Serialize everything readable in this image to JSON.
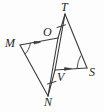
{
  "figure": {
    "kind": "geometry-diagram",
    "stroke_color": "#3c3c3c",
    "label_color": "#262626",
    "background_color": "#fdfdfd",
    "width": 104,
    "height": 112
  },
  "points": {
    "T": {
      "label": "T",
      "x": 65,
      "y": 14,
      "label_x": 61,
      "label_y": 1
    },
    "O": {
      "label": "O",
      "x": 58,
      "y": 38,
      "label_x": 43,
      "label_y": 26
    },
    "M": {
      "label": "M",
      "x": 20,
      "y": 45,
      "label_x": 5,
      "label_y": 37
    },
    "V": {
      "label": "V",
      "x": 55,
      "y": 70,
      "label_x": 57,
      "label_y": 71
    },
    "S": {
      "label": "S",
      "x": 87,
      "y": 68,
      "label_x": 89,
      "label_y": 66
    },
    "N": {
      "label": "N",
      "x": 48,
      "y": 96,
      "label_x": 44,
      "label_y": 96
    }
  },
  "segments": [
    {
      "name": "segment-MO",
      "from": "M",
      "to": "O",
      "marks": "single-arrow"
    },
    {
      "name": "segment-MN",
      "from": "M",
      "to": "N",
      "marks": "none"
    },
    {
      "name": "segment-ON",
      "from": "O",
      "to": "N",
      "marks": "none"
    },
    {
      "name": "segment-TV",
      "from": "T",
      "to": "V",
      "marks": "none"
    },
    {
      "name": "segment-TS",
      "from": "T",
      "to": "S",
      "marks": "none"
    },
    {
      "name": "segment-VS",
      "from": "V",
      "to": "S",
      "marks": "single-arrow"
    },
    {
      "name": "segment-OT",
      "from": "O",
      "to": "T",
      "marks": "single-tick"
    },
    {
      "name": "segment-VN",
      "from": "V",
      "to": "N",
      "marks": "single-tick"
    }
  ],
  "angle_arcs": [
    {
      "name": "angle-arc-M",
      "vertex": "M",
      "marks": "single-arc"
    },
    {
      "name": "angle-arc-S",
      "vertex": "S",
      "marks": "single-arc"
    }
  ],
  "tick_marks": [
    {
      "name": "tick-mark-OT",
      "on": "segment-OT"
    },
    {
      "name": "tick-mark-VN",
      "on": "segment-VN"
    }
  ],
  "arrow_marks": [
    {
      "name": "arrow-mark-MO",
      "on": "segment-MO"
    },
    {
      "name": "arrow-mark-VS",
      "on": "segment-VS"
    }
  ]
}
